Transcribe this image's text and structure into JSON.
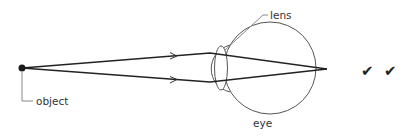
{
  "diagram": {
    "labels": {
      "object": "object",
      "lens": "lens",
      "eye": "eye"
    },
    "marks": {
      "check_1": "✔",
      "check_2": "✔"
    },
    "colors": {
      "ray": "#222222",
      "outline": "#555555",
      "leader": "#888888",
      "text": "#333333"
    }
  }
}
